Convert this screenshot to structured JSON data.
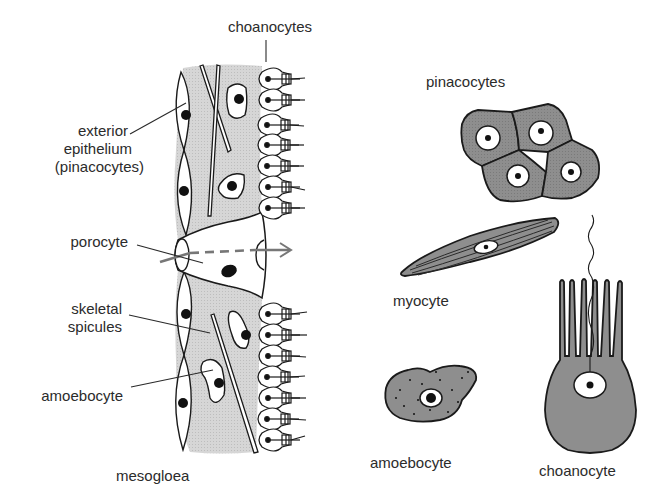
{
  "diagram": {
    "left_panel": {
      "labels": {
        "choanocytes": "choanocytes",
        "exterior_epithelium_line1": "exterior",
        "exterior_epithelium_line2": "epithelium",
        "exterior_epithelium_line3": "(pinacocytes)",
        "porocyte": "porocyte",
        "skeletal_spicules_line1": "skeletal",
        "skeletal_spicules_line2": "spicules",
        "amoebocyte": "amoebocyte",
        "mesogloea": "mesogloea"
      }
    },
    "right_panel": {
      "labels": {
        "pinacocytes": "pinacocytes",
        "myocyte": "myocyte",
        "amoebocyte": "amoebocyte",
        "choanocyte": "choanocyte"
      }
    },
    "colors": {
      "outline": "#1a1a1a",
      "mesogloea_fill": "#d4d4d4",
      "cell_fill": "#8c8c8c",
      "nucleus": "#111111",
      "background": "#ffffff",
      "water_flow_arrow": "#777777"
    }
  }
}
